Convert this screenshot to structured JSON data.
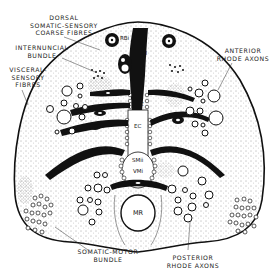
{
  "figure": {
    "colors": {
      "ink": "#111111",
      "paper": "#ffffff",
      "stipple": "#444444"
    }
  },
  "labels": {
    "dorsal": "DORSAL\nSOMATIC-SENSORY\nCOARSE FIBRES",
    "internuncial": "INTERNUNCIAL\nBUNDLE",
    "visceral": "VISCERAL-\nSENSORY\nFIBRES",
    "anterior_rhode": "ANTERIOR\nRHODE AXONS",
    "posterior_rhode": "POSTERIOR\nRHODE AXONS",
    "somatic_motor": "SOMATIC-MOTOR\nBUNDLE"
  },
  "internal_labels": {
    "rbi": "RBi",
    "ji": "JI",
    "rbii": "RBii",
    "mc": "MC",
    "ec": "EC",
    "smii": "SMii",
    "vmi": "VMi",
    "mr": "MR"
  }
}
